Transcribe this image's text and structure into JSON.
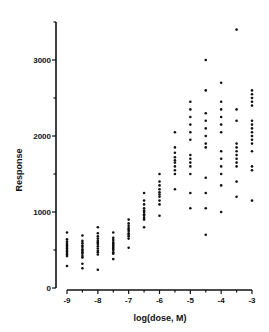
{
  "chart_data": {
    "type": "scatter",
    "title": "",
    "xlabel": "log(dose, M)",
    "ylabel": "Response",
    "xlim": [
      -9,
      -3
    ],
    "ylim": [
      0,
      3500
    ],
    "x_ticks": [
      -9,
      -8,
      -7,
      -6,
      -5,
      -4,
      -3
    ],
    "x_tick_labels": [
      "-9",
      "-8",
      "-7",
      "-6",
      "-5",
      "-4",
      "-3"
    ],
    "y_ticks": [
      0,
      1000,
      2000,
      3000
    ],
    "y_tick_labels": [
      "0",
      "1000",
      "2000",
      "3000"
    ],
    "y_minor_ticks": [
      500,
      1500,
      2500,
      3500
    ],
    "grid": false,
    "legend": null,
    "series": [
      {
        "name": "Response",
        "points": [
          {
            "x": -9,
            "y": [
              730,
              640,
              610,
              580,
              560,
              540,
              520,
              500,
              480,
              460,
              440,
              420,
              290
            ]
          },
          {
            "x": -8.5,
            "y": [
              690,
              620,
              590,
              560,
              540,
              510,
              490,
              470,
              450,
              420,
              400,
              320,
              260
            ]
          },
          {
            "x": -8,
            "y": [
              800,
              720,
              680,
              650,
              620,
              600,
              580,
              550,
              520,
              490,
              470,
              440,
              240
            ]
          },
          {
            "x": -7.5,
            "y": [
              730,
              660,
              630,
              600,
              580,
              560,
              540,
              520,
              500,
              470,
              450,
              380
            ]
          },
          {
            "x": -7,
            "y": [
              900,
              850,
              820,
              790,
              770,
              750,
              720,
              700,
              680,
              650,
              530
            ]
          },
          {
            "x": -6.5,
            "y": [
              1250,
              1150,
              1100,
              1050,
              1020,
              1000,
              970,
              950,
              920,
              900,
              800
            ]
          },
          {
            "x": -6,
            "y": [
              1500,
              1400,
              1350,
              1300,
              1260,
              1230,
              1200,
              1150,
              1100,
              950
            ]
          },
          {
            "x": -5.5,
            "y": [
              2050,
              1850,
              1780,
              1720,
              1680,
              1650,
              1600,
              1550,
              1500,
              1300
            ]
          },
          {
            "x": -5,
            "y": [
              2450,
              2350,
              2250,
              2150,
              2050,
              1950,
              1750,
              1700,
              1650,
              1600,
              1500,
              1250,
              1050
            ]
          },
          {
            "x": -4.5,
            "y": [
              3000,
              2600,
              2300,
              2200,
              2100,
              2000,
              1900,
              1850,
              1450,
              1250,
              1050,
              700
            ]
          },
          {
            "x": -4,
            "y": [
              2700,
              2450,
              2350,
              2250,
              2150,
              2050,
              1800,
              1700,
              1600,
              1500,
              1350,
              1000
            ]
          },
          {
            "x": -3.5,
            "y": [
              3400,
              2350,
              2200,
              1900,
              1850,
              1800,
              1750,
              1700,
              1650,
              1600,
              1400,
              1200
            ]
          },
          {
            "x": -3,
            "y": [
              2600,
              2550,
              2500,
              2450,
              2400,
              2200,
              2150,
              2100,
              2050,
              2000,
              1950,
              1900,
              1800,
              1600,
              1550,
              1150
            ]
          }
        ]
      }
    ]
  },
  "layout": {
    "plot_left": 56,
    "x_axis_start": 67,
    "x_axis_end": 252,
    "y_axis_top": 22,
    "y_zero_px": 288,
    "x_axis_y": 290,
    "px_per_1000": 76,
    "point_color": "#111111",
    "axis_color": "#111111"
  }
}
